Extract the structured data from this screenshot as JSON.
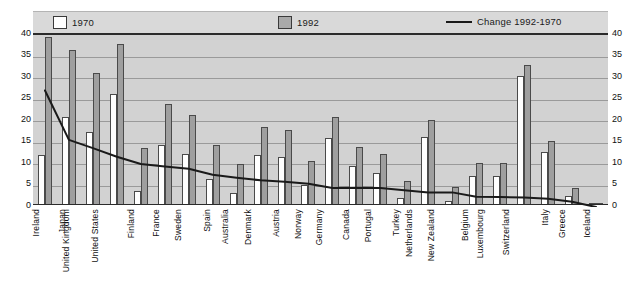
{
  "legend": {
    "items": [
      {
        "label": "1970",
        "marker": "white-box-swatch"
      },
      {
        "label": "1992",
        "marker": "gray-box-swatch"
      },
      {
        "label": "Change 1992-1970",
        "marker": "black-line-swatch"
      }
    ]
  },
  "axis": {
    "y_ticks": [
      "40",
      "35",
      "30",
      "25",
      "20",
      "15",
      "10",
      "5",
      "0"
    ]
  },
  "chart_data": {
    "type": "bar",
    "title": "",
    "subtitle": "",
    "xlabel": "",
    "ylabel": "",
    "ylim": [
      0,
      40
    ],
    "ytick_values": [
      0,
      5,
      10,
      15,
      20,
      25,
      30,
      35,
      40
    ],
    "grid": true,
    "legend_position": "top",
    "secondary_axis": {
      "label": "",
      "ylim": [
        0,
        40
      ],
      "mirrored": true
    },
    "categories": [
      "Ireland",
      "Japan",
      "United Kingdom",
      "United States",
      "Finland",
      "France",
      "Sweden",
      "Spain",
      "Australia",
      "Denmark",
      "Austria",
      "Norway",
      "Germany",
      "Canada",
      "Portugal",
      "Turkey",
      "Netherlands",
      "New Zealand",
      "Belgium",
      "Luxembourg",
      "Switzerland",
      "Italy",
      "Greece",
      "Iceland"
    ],
    "series": [
      {
        "name": "1970",
        "type": "bar",
        "color": "#ffffff",
        "values": [
          11.3,
          20.2,
          16.8,
          25.5,
          3.0,
          13.8,
          11.6,
          5.9,
          2.6,
          11.4,
          10.9,
          4.4,
          15.3,
          8.8,
          7.3,
          1.4,
          15.5,
          0.6,
          6.5,
          6.5,
          29.8,
          12.0,
          1.8,
          0.2
        ]
      },
      {
        "name": "1992",
        "type": "bar",
        "color": "#9f9f9f",
        "values": [
          38.9,
          35.8,
          30.5,
          37.2,
          13.1,
          23.2,
          20.6,
          13.7,
          9.3,
          17.8,
          17.3,
          9.9,
          20.3,
          13.3,
          11.7,
          5.4,
          19.5,
          4.0,
          9.5,
          9.5,
          32.4,
          14.7,
          3.8,
          0.3
        ]
      },
      {
        "name": "Change 1992-1970",
        "type": "line",
        "color": "#1a1a1a",
        "values": [
          27.1,
          15.6,
          13.7,
          11.7,
          10.0,
          9.4,
          8.9,
          7.5,
          6.8,
          6.2,
          5.9,
          5.4,
          4.4,
          4.5,
          4.4,
          3.9,
          3.4,
          3.4,
          2.4,
          2.3,
          2.2,
          1.9,
          1.2,
          0.0
        ]
      }
    ]
  }
}
